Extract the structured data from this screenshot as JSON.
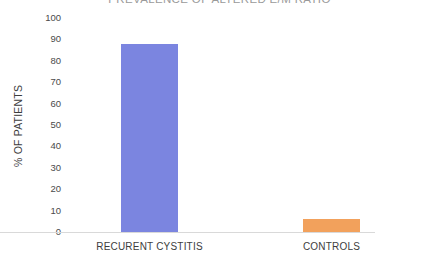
{
  "chart_data": {
    "type": "bar",
    "title": "PREVALENCE OF ALTERED E/M RATIO",
    "xlabel": "",
    "ylabel": "% OF PATIENTS",
    "categories": [
      "RECURENT CYSTITIS",
      "CONTROLS"
    ],
    "values": [
      88,
      6
    ],
    "colors": [
      "#7b85e0",
      "#f2a15c"
    ],
    "ylim": [
      0,
      100
    ],
    "yticks": [
      100,
      90,
      80,
      70,
      60,
      50,
      40,
      30,
      20,
      10,
      0
    ],
    "ytick_labels": [
      "100",
      "90",
      "80",
      "70",
      "60",
      "50",
      "40",
      "30",
      "20",
      "10",
      "0"
    ],
    "grid": false,
    "legend": false,
    "series": [
      {
        "name": "% OF PATIENTS",
        "values": [
          88,
          6
        ]
      }
    ]
  },
  "axis": {
    "y_title": "% OF PATIENTS"
  },
  "bars": [
    {
      "label": "RECURENT CYSTITIS",
      "value": 88,
      "color": "#7b85e0"
    },
    {
      "label": "CONTROLS",
      "value": 6,
      "color": "#f2a15c"
    }
  ]
}
